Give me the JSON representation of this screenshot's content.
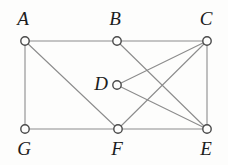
{
  "figure": {
    "background_color": "#fdfdfc",
    "edge_color": "#8c8c8c",
    "vertex_stroke_color": "#4a4a4a",
    "vertex_fill_color": "#fdfdfc",
    "label_color": "#1c1c1c",
    "width": 228,
    "height": 165
  },
  "graph": {
    "type": "undirected",
    "vertices": [
      {
        "id": "A",
        "label": "A",
        "cx": 25,
        "cy": 41,
        "r": 4.2,
        "label_x": 23,
        "label_y": 9,
        "label_anchor": "above"
      },
      {
        "id": "B",
        "label": "B",
        "cx": 117,
        "cy": 41,
        "r": 4.2,
        "label_x": 115,
        "label_y": 9,
        "label_anchor": "above"
      },
      {
        "id": "C",
        "label": "C",
        "cx": 207,
        "cy": 41,
        "r": 4.2,
        "label_x": 206,
        "label_y": 9,
        "label_anchor": "above"
      },
      {
        "id": "D",
        "label": "D",
        "cx": 117,
        "cy": 85,
        "r": 4.2,
        "label_x": 101,
        "label_y": 74,
        "label_anchor": "left"
      },
      {
        "id": "G",
        "label": "G",
        "cx": 25,
        "cy": 129,
        "r": 4.2,
        "label_x": 24,
        "label_y": 139,
        "label_anchor": "below"
      },
      {
        "id": "F",
        "label": "F",
        "cx": 118,
        "cy": 129,
        "r": 4.2,
        "label_x": 117,
        "label_y": 139,
        "label_anchor": "below"
      },
      {
        "id": "E",
        "label": "E",
        "cx": 207,
        "cy": 129,
        "r": 4.2,
        "label_x": 206,
        "label_y": 139,
        "label_anchor": "below"
      }
    ],
    "edges": [
      {
        "from": "A",
        "to": "B"
      },
      {
        "from": "B",
        "to": "C"
      },
      {
        "from": "A",
        "to": "G"
      },
      {
        "from": "A",
        "to": "F"
      },
      {
        "from": "G",
        "to": "F"
      },
      {
        "from": "F",
        "to": "E"
      },
      {
        "from": "C",
        "to": "E"
      },
      {
        "from": "B",
        "to": "E"
      },
      {
        "from": "C",
        "to": "F"
      },
      {
        "from": "C",
        "to": "D"
      },
      {
        "from": "D",
        "to": "E"
      }
    ]
  }
}
